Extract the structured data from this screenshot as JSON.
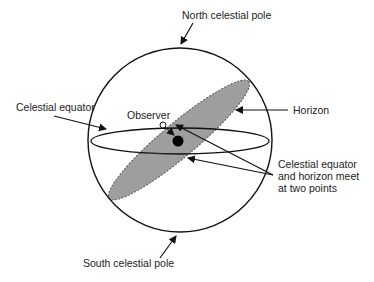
{
  "diagram": {
    "labels": {
      "north_pole": "North celestial pole",
      "south_pole": "South celestial pole",
      "celestial_equator": "Celestial equator",
      "horizon": "Horizon",
      "observer": "Observer",
      "meet_line1": "Celestial equator",
      "meet_line2": "and horizon meet",
      "meet_line3": "at two points"
    },
    "colors": {
      "stroke": "#111111",
      "horizon_fill": "#9e9e9e",
      "background": "#ffffff"
    }
  }
}
